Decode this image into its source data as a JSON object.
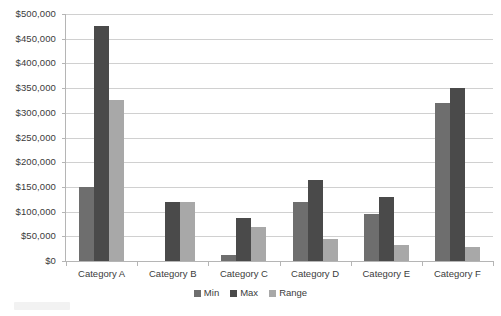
{
  "chart_data": {
    "type": "bar",
    "title": "",
    "subtitle": "",
    "xlabel": "",
    "ylabel": "",
    "categories": [
      "Category A",
      "Category B",
      "Category C",
      "Category D",
      "Category E",
      "Category F"
    ],
    "series": [
      {
        "name": "Min",
        "color": "#6e6e6e",
        "values": [
          150000,
          0,
          13000,
          120000,
          96000,
          320000
        ]
      },
      {
        "name": "Max",
        "color": "#4a4a4a",
        "values": [
          475000,
          120000,
          88000,
          165000,
          130000,
          350000
        ]
      },
      {
        "name": "Range",
        "color": "#a8a8a8",
        "values": [
          325000,
          120000,
          68000,
          44000,
          32000,
          28000
        ]
      }
    ],
    "ylim": [
      0,
      500000
    ],
    "ytick_step": 50000,
    "ytick_labels": [
      "$500,000",
      "$450,000",
      "$400,000",
      "$350,000",
      "$300,000",
      "$250,000",
      "$200,000",
      "$150,000",
      "$100,000",
      "$50,000",
      "$0"
    ],
    "ytick_values": [
      500000,
      450000,
      400000,
      350000,
      300000,
      250000,
      200000,
      150000,
      100000,
      50000,
      0
    ],
    "grid": "horizontal",
    "legend_position": "bottom",
    "legend": [
      "Min",
      "Max",
      "Range"
    ],
    "colors": {
      "min": "#6e6e6e",
      "max": "#4a4a4a",
      "range": "#a8a8a8",
      "gridline": "#d0d0d0",
      "axis": "#b5b5b5",
      "text": "#3b3b3b",
      "background": "#ffffff"
    }
  }
}
